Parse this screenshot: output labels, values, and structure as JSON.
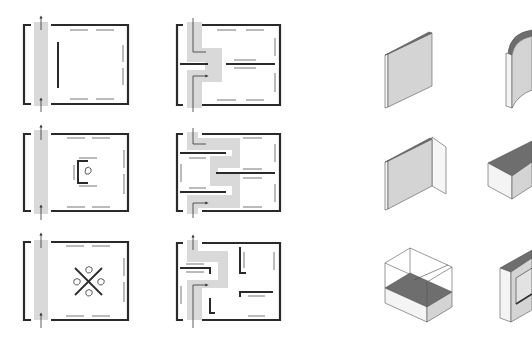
{
  "diagram": {
    "colors": {
      "background": "#ffffff",
      "wall": "#2a2a2a",
      "thin_wall": "#555555",
      "circulation": "#d6d6d6",
      "iso_face_light": "#f6f6f6",
      "iso_face_mid": "#d4d4d4",
      "iso_face_dark": "#6e6e6e",
      "iso_edge": "#444444"
    },
    "plans": [
      {
        "id": "plan-linear-side-corridor",
        "row": 1,
        "col": 1,
        "circulation": "straight corridor along left edge"
      },
      {
        "id": "plan-offset-central-spine",
        "row": 1,
        "col": 2,
        "circulation": "offset path through central partition"
      },
      {
        "id": "plan-linear-with-alcove",
        "row": 2,
        "col": 1,
        "circulation": "straight corridor, central alcove with object"
      },
      {
        "id": "plan-serpentine",
        "row": 2,
        "col": 2,
        "circulation": "serpentine path through parallel partitions"
      },
      {
        "id": "plan-linear-with-crossed-objects",
        "row": 3,
        "col": 1,
        "circulation": "straight corridor, crossed walls with four objects"
      },
      {
        "id": "plan-branching-rooms",
        "row": 3,
        "col": 2,
        "circulation": "branching path into L-shaped rooms"
      }
    ],
    "iso_elements": [
      {
        "id": "iso-flat-panel",
        "row": 1,
        "col": 1,
        "label": "flat wall panel"
      },
      {
        "id": "iso-curved-wall",
        "row": 1,
        "col": 2,
        "label": "curved wall"
      },
      {
        "id": "iso-corner-wall",
        "row": 2,
        "col": 1,
        "label": "L-shaped corner wall"
      },
      {
        "id": "iso-block-plinth",
        "row": 2,
        "col": 2,
        "label": "solid block / plinth"
      },
      {
        "id": "iso-vitrine",
        "row": 3,
        "col": 1,
        "label": "display case / vitrine"
      },
      {
        "id": "iso-wall-case",
        "row": 3,
        "col": 2,
        "label": "wall display case"
      }
    ]
  }
}
